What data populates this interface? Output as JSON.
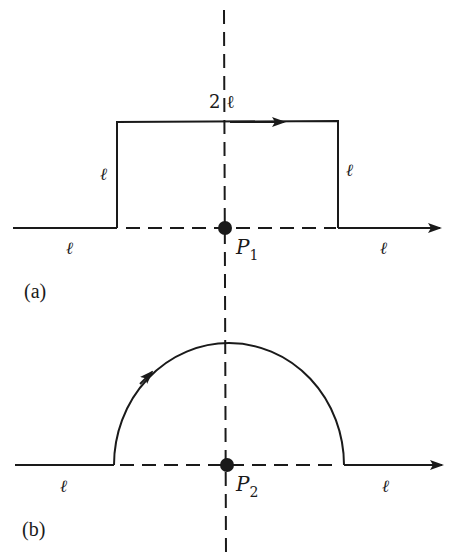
{
  "figure": {
    "colors": {
      "stroke": "#1a1a1a",
      "background": "#ffffff"
    },
    "part_a": {
      "label": "(a)",
      "top_segment_label": "2 ℓ",
      "left_vertical_label": "ℓ",
      "right_vertical_label": "ℓ",
      "left_horizontal_label": "ℓ",
      "right_horizontal_label": "ℓ",
      "point_label": "P",
      "point_subscript": "1",
      "shape": "rectangular detour of width 2ℓ and height ℓ above the axis"
    },
    "part_b": {
      "label": "(b)",
      "left_horizontal_label": "ℓ",
      "right_horizontal_label": "ℓ",
      "point_label": "P",
      "point_subscript": "2",
      "shape": "semicircular detour of radius ℓ centered at P2"
    }
  }
}
